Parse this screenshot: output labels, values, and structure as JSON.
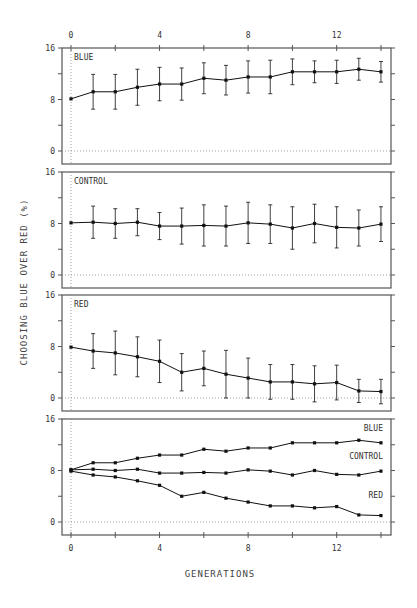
{
  "chart_data": {
    "type": "line",
    "xlabel": "GENERATIONS",
    "ylabel": "CHOOSING BLUE OVER RED (%)",
    "x": [
      0,
      1,
      2,
      3,
      4,
      5,
      6,
      7,
      8,
      9,
      10,
      11,
      12,
      13,
      14
    ],
    "x_ticks": [
      0,
      4,
      8,
      12
    ],
    "y_ticks": [
      0,
      8,
      16
    ],
    "ylim": [
      -2,
      16
    ],
    "xlim": [
      -0.4,
      14.4
    ],
    "grid": false,
    "zero_line": "dotted",
    "panels": [
      {
        "label": "BLUE",
        "error_bars": true,
        "series": [
          {
            "name": "BLUE",
            "values": [
              8.1,
              9.2,
              9.2,
              9.9,
              10.4,
              10.4,
              11.3,
              11.0,
              11.5,
              11.5,
              12.3,
              12.3,
              12.3,
              12.7,
              12.3
            ],
            "errors": [
              0,
              2.7,
              2.7,
              2.8,
              2.6,
              2.5,
              2.4,
              2.3,
              2.5,
              2.6,
              2.0,
              1.7,
              1.8,
              1.7,
              1.6
            ]
          }
        ]
      },
      {
        "label": "CONTROL",
        "error_bars": true,
        "series": [
          {
            "name": "CONTROL",
            "values": [
              8.1,
              8.2,
              8.0,
              8.2,
              7.6,
              7.6,
              7.7,
              7.6,
              8.1,
              7.9,
              7.3,
              8.0,
              7.4,
              7.3,
              7.9
            ],
            "errors": [
              0,
              2.5,
              2.3,
              2.1,
              2.1,
              2.8,
              3.2,
              3.1,
              3.2,
              3.0,
              3.3,
              3.0,
              3.2,
              2.8,
              2.7
            ]
          }
        ]
      },
      {
        "label": "RED",
        "error_bars": true,
        "series": [
          {
            "name": "RED",
            "values": [
              7.9,
              7.3,
              7.0,
              6.4,
              5.7,
              4.0,
              4.6,
              3.7,
              3.1,
              2.5,
              2.5,
              2.2,
              2.4,
              1.1,
              1.0
            ],
            "errors": [
              0,
              2.7,
              3.4,
              3.1,
              3.3,
              2.9,
              2.7,
              3.7,
              3.1,
              2.7,
              2.7,
              2.8,
              2.7,
              1.8,
              1.9
            ]
          }
        ]
      },
      {
        "label": "",
        "error_bars": false,
        "series": [
          {
            "name": "BLUE",
            "values": [
              8.1,
              9.2,
              9.2,
              9.9,
              10.4,
              10.4,
              11.3,
              11.0,
              11.5,
              11.5,
              12.3,
              12.3,
              12.3,
              12.7,
              12.3
            ]
          },
          {
            "name": "CONTROL",
            "values": [
              8.1,
              8.2,
              8.0,
              8.2,
              7.6,
              7.6,
              7.7,
              7.6,
              8.1,
              7.9,
              7.3,
              8.0,
              7.4,
              7.3,
              7.9
            ]
          },
          {
            "name": "RED",
            "values": [
              7.9,
              7.3,
              7.0,
              6.4,
              5.7,
              4.0,
              4.6,
              3.7,
              3.1,
              2.5,
              2.5,
              2.2,
              2.4,
              1.1,
              1.0
            ]
          }
        ],
        "annotations": [
          {
            "text": "BLUE",
            "gen": 14,
            "value": 14.2
          },
          {
            "text": "CONTROL",
            "gen": 14,
            "value": 9.8
          },
          {
            "text": "RED",
            "gen": 14,
            "value": 3.8
          }
        ]
      }
    ]
  },
  "labels": {
    "xlabel": "GENERATIONS",
    "ylabel": "CHOOSING BLUE OVER RED (%)",
    "y_tick_labels": [
      "16",
      "8",
      "0"
    ],
    "x_tick_labels": [
      "0",
      "4",
      "8",
      "12"
    ]
  },
  "colors": {
    "line": "#111111",
    "frame": "#555555",
    "dotted": "#888888",
    "text": "#333333"
  }
}
